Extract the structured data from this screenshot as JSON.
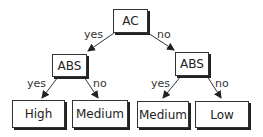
{
  "diagram": {
    "type": "decision-tree",
    "nodes": {
      "root": "AC",
      "left": "ABS",
      "right": "ABS",
      "ll": "High",
      "lr": "Medium",
      "rl": "Medium",
      "rr": "Low"
    },
    "edges": {
      "root_left": "yes",
      "root_right": "no",
      "left_ll": "yes",
      "left_lr": "no",
      "right_rl": "yes",
      "right_rr": "no"
    }
  }
}
